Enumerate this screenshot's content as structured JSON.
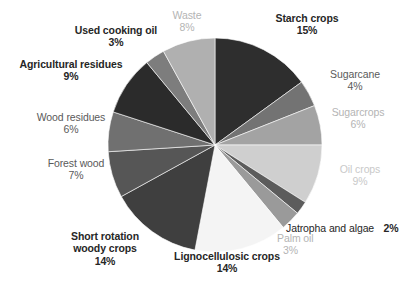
{
  "chart_data": {
    "type": "pie",
    "title": "",
    "subtitle": "",
    "xlabel": "",
    "ylabel": "",
    "legend_position": "none",
    "grid": false,
    "units": "%",
    "start_angle_deg": 0,
    "direction": "clockwise",
    "total": 100,
    "categories": [
      "Starch crops",
      "Sugarcane",
      "Sugarcrops",
      "Oil crops",
      "Jatropha and algae",
      "Palm oil",
      "Lignocellulosic crops",
      "Short rotation woody crops",
      "Forest wood",
      "Wood residues",
      "Agricultural residues",
      "Used cooking oil",
      "Waste"
    ],
    "values": [
      15,
      4,
      6,
      9,
      2,
      3,
      14,
      14,
      7,
      6,
      9,
      3,
      8
    ],
    "slices": [
      {
        "label": "Starch crops",
        "value": 15,
        "value_text": "15%",
        "color": "#2e2e2e"
      },
      {
        "label": "Sugarcane",
        "value": 4,
        "value_text": "4%",
        "color": "#737373"
      },
      {
        "label": "Sugarcrops",
        "value": 6,
        "value_text": "6%",
        "color": "#a3a3a3"
      },
      {
        "label": "Oil crops",
        "value": 9,
        "value_text": "9%",
        "color": "#cfcfcf"
      },
      {
        "label": "Jatropha and algae",
        "value": 2,
        "value_text": "2%",
        "color": "#5c5c5c"
      },
      {
        "label": "Palm oil",
        "value": 3,
        "value_text": "3%",
        "color": "#9a9a9a"
      },
      {
        "label": "Lignocellulosic crops",
        "value": 14,
        "value_text": "14%",
        "color": "#f4f4f4"
      },
      {
        "label": "Short rotation woody crops",
        "value": 14,
        "value_text": "14%",
        "color": "#3f3f3f"
      },
      {
        "label": "Forest wood",
        "value": 7,
        "value_text": "7%",
        "color": "#565656"
      },
      {
        "label": "Wood residues",
        "value": 6,
        "value_text": "6%",
        "color": "#707070"
      },
      {
        "label": "Agricultural residues",
        "value": 9,
        "value_text": "9%",
        "color": "#2b2b2b"
      },
      {
        "label": "Used cooking oil",
        "value": 3,
        "value_text": "3%",
        "color": "#7d7d7d"
      },
      {
        "label": "Waste",
        "value": 8,
        "value_text": "8%",
        "color": "#b0b0b0"
      }
    ]
  },
  "labels": {
    "starch_crops": {
      "name": "Starch crops",
      "value": "15%"
    },
    "sugarcane": {
      "name": "Sugarcane",
      "value": "4%"
    },
    "sugarcrops": {
      "name": "Sugarcrops",
      "value": "6%"
    },
    "oil_crops": {
      "name": "Oil crops",
      "value": "9%"
    },
    "jatropha_and_algae": {
      "name": "Jatropha and algae",
      "value": "2%"
    },
    "palm_oil": {
      "name": "Palm oil",
      "value": "3%"
    },
    "lignocellulosic": {
      "name": "Lignocellulosic crops",
      "value": "14%"
    },
    "short_rotation": {
      "name_line1": "Short rotation",
      "name_line2": "woody crops",
      "value": "14%"
    },
    "forest_wood": {
      "name": "Forest wood",
      "value": "7%"
    },
    "wood_residues": {
      "name": "Wood residues",
      "value": "6%"
    },
    "agricultural_res": {
      "name": "Agricultural residues",
      "value": "9%"
    },
    "used_cooking_oil": {
      "name": "Used cooking oil",
      "value": "3%"
    },
    "waste": {
      "name": "Waste",
      "value": "8%"
    }
  }
}
